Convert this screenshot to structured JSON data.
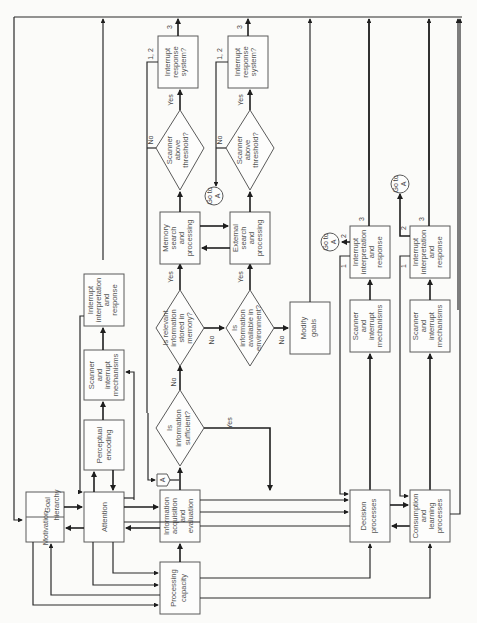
{
  "diagram": {
    "orientation": "rotated 90 degrees counter-clockwise",
    "nodes": {
      "motivation": "Motivation",
      "goal_hierarchy": [
        "Goal",
        "hierarchy"
      ],
      "attention": "Attention",
      "perceptual_encoding": [
        "Perceptual",
        "encoding"
      ],
      "scanner_interrupt_1": [
        "Scanner",
        "and",
        "interrupt",
        "mechanisms"
      ],
      "interrupt_interp_1": [
        "Interrupt",
        "interpretation",
        "and",
        "response"
      ],
      "info_acq": [
        "Information",
        "acquisition",
        "and",
        "evaluation"
      ],
      "processing_capacity": [
        "Processing",
        "capacity"
      ],
      "info_sufficient": [
        "Is",
        "information",
        "sufficient?"
      ],
      "relevant_memory": [
        "Is relevant",
        "information",
        "stored in",
        "memory?"
      ],
      "info_environment": [
        "Is",
        "information",
        "available in",
        "environment?"
      ],
      "memory_search": [
        "Memory",
        "search",
        "and",
        "processing"
      ],
      "external_search": [
        "External",
        "search",
        "and",
        "processing"
      ],
      "scanner_threshold_1": [
        "Scanner",
        "above",
        "threshold?"
      ],
      "scanner_threshold_2": [
        "Scanner",
        "above",
        "threshold?"
      ],
      "interrupt_response_1": [
        "Interrupt",
        "response",
        "system?"
      ],
      "interrupt_response_2": [
        "Interrupt",
        "response",
        "system?"
      ],
      "modify_goals": [
        "Modify",
        "goals"
      ],
      "scanner_interrupt_2": [
        "Scanner",
        "and",
        "interrupt",
        "mechanisms"
      ],
      "interrupt_interp_2": [
        "Interrupt",
        "interpretation",
        "and",
        "response"
      ],
      "decision": [
        "Decision",
        "processes"
      ],
      "scanner_interrupt_3": [
        "Scanner",
        "and",
        "interrupt",
        "mechanisms"
      ],
      "interrupt_interp_3": [
        "Interrupt",
        "interpretation",
        "and",
        "response"
      ],
      "consumption": [
        "Consumption",
        "and",
        "learning",
        "processes"
      ]
    },
    "edge_labels": {
      "yes": "Yes",
      "no": "No",
      "one_two": "1, 2",
      "one": "1",
      "two": "2",
      "three": "3"
    },
    "connectors": {
      "goto_a": [
        "Go to",
        "A"
      ],
      "a": "A"
    }
  }
}
